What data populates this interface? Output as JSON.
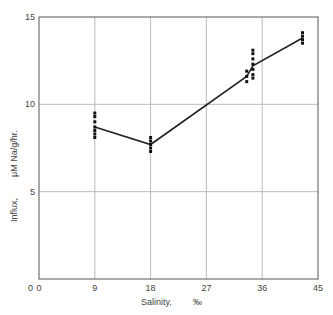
{
  "chart_data": {
    "type": "scatter",
    "title": "",
    "xlabel": "Salinity,",
    "xlabel_unit": "‰",
    "ylabel": "Influx,",
    "ylabel_unit": "μM Na/g/hr.",
    "xlim": [
      0,
      45
    ],
    "ylim": [
      0,
      15
    ],
    "x_ticks": [
      0,
      9,
      18,
      27,
      36,
      45
    ],
    "y_ticks": [
      5,
      10,
      15
    ],
    "grid": true,
    "series": [
      {
        "name": "individual measurements",
        "kind": "points",
        "points": [
          [
            9,
            9.5
          ],
          [
            9,
            9.3
          ],
          [
            9,
            9.0
          ],
          [
            9,
            8.7
          ],
          [
            9,
            8.5
          ],
          [
            9,
            8.3
          ],
          [
            9,
            8.1
          ],
          [
            18,
            8.1
          ],
          [
            18,
            7.9
          ],
          [
            18,
            7.7
          ],
          [
            18,
            7.5
          ],
          [
            18,
            7.3
          ],
          [
            33.5,
            11.9
          ],
          [
            33.5,
            11.6
          ],
          [
            33.5,
            11.3
          ],
          [
            34.5,
            13.1
          ],
          [
            34.5,
            12.9
          ],
          [
            34.5,
            12.6
          ],
          [
            34.5,
            12.3
          ],
          [
            34.5,
            12.0
          ],
          [
            34.5,
            11.7
          ],
          [
            34.5,
            11.5
          ],
          [
            42.5,
            14.1
          ],
          [
            42.5,
            13.9
          ],
          [
            42.5,
            13.7
          ],
          [
            42.5,
            13.5
          ]
        ]
      },
      {
        "name": "mean line",
        "kind": "line",
        "points": [
          [
            9,
            8.7
          ],
          [
            18,
            7.7
          ],
          [
            33.5,
            11.6
          ],
          [
            34.5,
            12.2
          ],
          [
            42.5,
            13.8
          ]
        ]
      }
    ]
  }
}
